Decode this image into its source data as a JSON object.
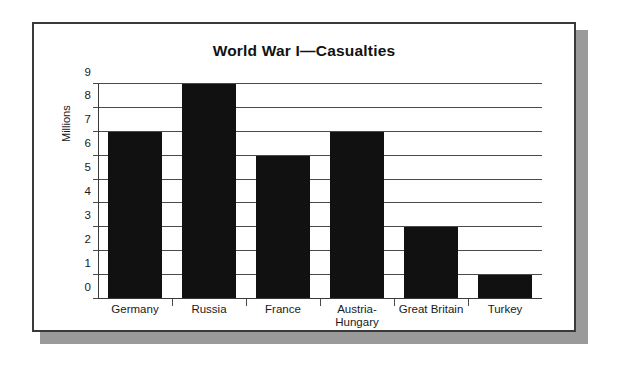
{
  "chart_data": {
    "type": "bar",
    "title": "World War I—Casualties",
    "xlabel": "",
    "ylabel": "Millions",
    "categories": [
      "Germany",
      "Russia",
      "France",
      "Austria-\nHungary",
      "Great Britain",
      "Turkey"
    ],
    "values": [
      7,
      9,
      6,
      7,
      3,
      1
    ],
    "ylim": [
      0,
      9
    ],
    "yticks": [
      0,
      1,
      2,
      3,
      4,
      5,
      6,
      7,
      8,
      9
    ],
    "ytick_labels": [
      "0",
      "1",
      "2",
      "3",
      "4",
      "5",
      "6",
      "7",
      "8",
      "9"
    ],
    "grid": true,
    "legend": null,
    "bar_color": "#111111",
    "gridline_color": "#4a4a4a",
    "axis_color": "#3a3a3a",
    "frame_color": "#3a3a3a",
    "shadow_color": "#9a9a9a",
    "background_color": "#ffffff"
  }
}
